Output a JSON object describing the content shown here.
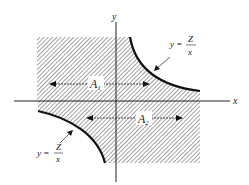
{
  "diagram": {
    "axis_x_label": "x",
    "axis_y_label": "y",
    "region_labels": {
      "a1": "A",
      "a1_sub": "1",
      "a2": "A",
      "a2_sub": "2"
    },
    "curve_label_upper": {
      "lhs": "y =",
      "num": "Z",
      "den": "x"
    },
    "curve_label_lower": {
      "lhs": "y =",
      "num": "Z",
      "den": "x"
    },
    "colors": {
      "ink": "#222222",
      "hatch": "#555555",
      "background": "#ffffff"
    }
  }
}
